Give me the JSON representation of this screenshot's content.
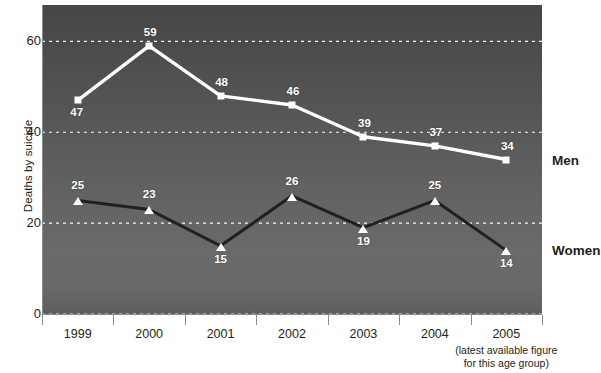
{
  "chart_data": {
    "type": "line",
    "title": "",
    "xlabel": "",
    "ylabel": "Deaths by suicide",
    "categories": [
      "1999",
      "2000",
      "2001",
      "2002",
      "2003",
      "2004",
      "2005"
    ],
    "x_tick_note": [
      "(latest available figure",
      "for this age group)"
    ],
    "x_tick_note_category": "2005",
    "ylim": [
      0,
      68
    ],
    "yticks": [
      0,
      20,
      40,
      60
    ],
    "ytick_labels": [
      "0",
      "20",
      "40",
      "60"
    ],
    "grid": "horizontal dashed white at 20, 40, 60",
    "legend_position": "right of plot, inline series labels",
    "series": [
      {
        "name": "Men",
        "marker": "square",
        "color": "#ffffff",
        "label_position": "below-left at 1999, above elsewhere",
        "values": [
          47,
          59,
          48,
          46,
          39,
          37,
          34
        ],
        "value_labels": [
          "47",
          "59",
          "48",
          "46",
          "39",
          "37",
          "34"
        ]
      },
      {
        "name": "Women",
        "marker": "triangle",
        "color": "#231f20",
        "label_position": "above for 1999, 2000, 2002, 2004; below for 2001, 2003, 2005",
        "values": [
          25,
          23,
          15,
          26,
          19,
          25,
          14
        ],
        "value_labels": [
          "25",
          "23",
          "15",
          "26",
          "19",
          "25",
          "14"
        ]
      }
    ]
  },
  "style": {
    "plot_bg_top": "#464646",
    "plot_bg_mid": "#6a6a6a",
    "plot_bg_bottom": "#5e5e5e",
    "gridline_color": "#ffffff",
    "men_line_color": "#ffffff",
    "women_line_color": "#231f20",
    "text_color": "#231f20",
    "page_bg": "#ffffff"
  }
}
